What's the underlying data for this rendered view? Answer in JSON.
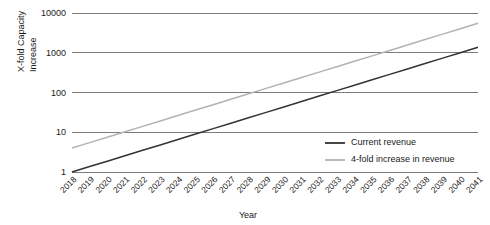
{
  "chart_data": {
    "type": "line",
    "title": "",
    "xlabel": "Year",
    "ylabel_line1": "X-fold Capacity",
    "ylabel_line2": "Increase",
    "yscale": "log",
    "ylim": [
      1,
      10000
    ],
    "ytick_labels": [
      "10000",
      "1000",
      "100",
      "10",
      "1"
    ],
    "ytick_values": [
      10000,
      1000,
      100,
      10,
      1
    ],
    "grid": true,
    "legend_position": "inside-bottom-right",
    "x": [
      "2018",
      "2019",
      "2020",
      "2021",
      "2022",
      "2023",
      "2024",
      "2025",
      "2026",
      "2027",
      "2028",
      "2029",
      "2030",
      "2031",
      "2032",
      "2033",
      "2034",
      "2035",
      "2036",
      "2037",
      "2038",
      "2039",
      "2040",
      "2041"
    ],
    "series": [
      {
        "name": "Current revenue",
        "color": "#333333",
        "values": [
          1,
          1.37,
          1.87,
          2.56,
          3.51,
          4.8,
          6.58,
          9.01,
          12.33,
          16.89,
          23.12,
          31.66,
          43.35,
          59.36,
          81.28,
          111.3,
          152.4,
          208.6,
          285.6,
          391.1,
          535.4,
          733.1,
          1003.7,
          1374.3
        ]
      },
      {
        "name": "4-fold increase in revenue",
        "color": "#b3b3b3",
        "values": [
          4,
          5.48,
          7.5,
          10.27,
          14.06,
          19.25,
          26.36,
          36.09,
          49.42,
          67.67,
          92.65,
          126.9,
          173.7,
          237.8,
          325.6,
          445.8,
          610.4,
          835.8,
          1144.4,
          1566.9,
          2145.4,
          2937.6,
          4022.4,
          5507.7
        ]
      }
    ],
    "annotations": []
  }
}
